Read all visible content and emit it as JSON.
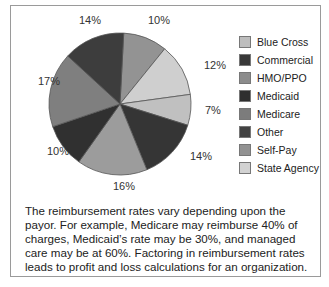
{
  "chart_data": {
    "type": "pie",
    "title": "",
    "slices": [
      {
        "label": "10%",
        "value": 10,
        "color": "#939393"
      },
      {
        "label": "12%",
        "value": 12,
        "color": "#cfcfcf"
      },
      {
        "label": "7%",
        "value": 7,
        "color": "#c0c0c0"
      },
      {
        "label": "14%",
        "value": 14,
        "color": "#353535"
      },
      {
        "label": "16%",
        "value": 16,
        "color": "#9c9c9c"
      },
      {
        "label": "10%",
        "value": 10,
        "color": "#303030"
      },
      {
        "label": "17%",
        "value": 17,
        "color": "#7f7f7f"
      },
      {
        "label": "14%",
        "value": 14,
        "color": "#3d3d3d"
      }
    ],
    "legend": [
      {
        "label": "Blue Cross",
        "color": "#bdbdbd"
      },
      {
        "label": "Commercial",
        "color": "#383838"
      },
      {
        "label": "HMO/PPO",
        "color": "#8c8c8c"
      },
      {
        "label": "Medicaid",
        "color": "#2f2f2f"
      },
      {
        "label": "Medicare",
        "color": "#7c7c7c"
      },
      {
        "label": "Other",
        "color": "#424242"
      },
      {
        "label": "Self-Pay",
        "color": "#929292"
      },
      {
        "label": "State Agency",
        "color": "#d2d2d2"
      }
    ],
    "legend_position": "right"
  },
  "description": "The reimbursement rates vary depending upon the payor. For example, Medicare may reimburse 40% of charges, Medicaid’s rate may be 30%, and managed care may be at 60%. Factoring in reimbursement rates leads to profit and loss calculations for an organization."
}
